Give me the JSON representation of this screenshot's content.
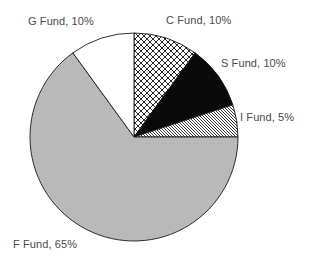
{
  "chart_data": {
    "type": "pie",
    "title": "",
    "start_angle_deg": 0,
    "direction": "clockwise",
    "geometry": {
      "cx": 134,
      "cy": 137,
      "r": 104
    },
    "slices": [
      {
        "label": "C Fund",
        "value": 10,
        "display": "C Fund, 10%",
        "fill": "crosshatch",
        "color": "#000000"
      },
      {
        "label": "S Fund",
        "value": 10,
        "display": "S Fund, 10%",
        "fill": "solid",
        "color": "#0a0a0a"
      },
      {
        "label": "I Fund",
        "value": 5,
        "display": "I Fund, 5%",
        "fill": "diagonal-hatch",
        "color": "#000000"
      },
      {
        "label": "F Fund",
        "value": 65,
        "display": "F Fund, 65%",
        "fill": "solid",
        "color": "#b9b9b9"
      },
      {
        "label": "G Fund",
        "value": 10,
        "display": "G Fund, 10%",
        "fill": "solid",
        "color": "#ffffff"
      }
    ],
    "categories": [
      "C Fund",
      "S Fund",
      "I Fund",
      "F Fund",
      "G Fund"
    ],
    "values": [
      10,
      10,
      5,
      65,
      10
    ],
    "legend": "none (data labels on slices)",
    "label_positions": [
      {
        "label": "C Fund",
        "x": 166,
        "y": 14
      },
      {
        "label": "S Fund",
        "x": 221,
        "y": 57
      },
      {
        "label": "I Fund",
        "x": 240,
        "y": 111
      },
      {
        "label": "F Fund",
        "x": 13,
        "y": 238
      },
      {
        "label": "G Fund",
        "x": 28,
        "y": 15
      }
    ]
  },
  "labels": {
    "c": "C Fund, 10%",
    "s": "S Fund, 10%",
    "i": "I Fund, 5%",
    "f": "F Fund, 65%",
    "g": "G Fund, 10%"
  },
  "colors": {
    "outline": "#1a1a1a",
    "f_fund": "#b9b9b9",
    "s_fund": "#0a0a0a",
    "g_fund": "#ffffff",
    "label_text": "#4a4a4a"
  }
}
